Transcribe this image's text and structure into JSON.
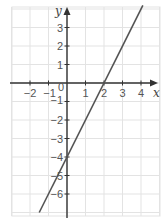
{
  "chart_data": {
    "type": "line",
    "title": "",
    "xlabel": "x",
    "ylabel": "y",
    "xlim": [
      -3,
      5
    ],
    "ylim": [
      -7,
      4.2
    ],
    "grid": true,
    "x_ticks": [
      -2,
      -1,
      0,
      1,
      2,
      3,
      4
    ],
    "x_tick_labels": [
      "−2",
      "−1",
      "0",
      "1",
      "2",
      "3",
      "4"
    ],
    "y_ticks": [
      3,
      2,
      1,
      -1,
      -2,
      -3,
      -4,
      -5,
      -6
    ],
    "y_tick_labels": [
      "3",
      "2",
      "1",
      "−1",
      "−2",
      "−3",
      "−4",
      "−5",
      "−6"
    ],
    "series": [
      {
        "name": "y = 2x − 4",
        "equation": "y = 2x - 4",
        "x": [
          -1.5,
          4.1
        ],
        "y": [
          -7,
          4.2
        ],
        "color": "#555555"
      }
    ],
    "annotations": {
      "x_intercept": [
        2,
        0
      ],
      "y_intercept": [
        0,
        -4
      ]
    }
  },
  "colors": {
    "grid": "#e3e3e3",
    "axis": "#333333",
    "line": "#555555",
    "text": "#555555"
  }
}
